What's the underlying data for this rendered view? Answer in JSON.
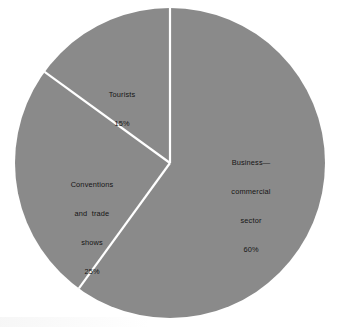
{
  "figure": {
    "background_color": "#ffffff",
    "slice_fill_color": "#8a8a8a",
    "divider_color": "#ffffff",
    "label_text_color": "#151515"
  },
  "chart_data": {
    "type": "pie",
    "title": "",
    "subtitle": "",
    "xlabel": "",
    "ylabel": "",
    "legend": "none",
    "grid": false,
    "start_angle_deg": 0,
    "direction": "clockwise",
    "center": {
      "x": 170,
      "y": 163
    },
    "radius": 155,
    "categories": [
      "Business—commercial sector",
      "Conventions and trade shows",
      "Tourists"
    ],
    "values": [
      60,
      25,
      15
    ],
    "unit": "%",
    "slices": [
      {
        "name": "Business—commercial sector",
        "value": 60,
        "value_label": "60%",
        "label_lines": [
          "Business—",
          "commercial",
          "sector"
        ],
        "color": "#8a8a8a",
        "start_deg": 0,
        "end_deg": 216
      },
      {
        "name": "Conventions and trade shows",
        "value": 25,
        "value_label": "25%",
        "label_lines": [
          "Conventions",
          "and  trade",
          "shows"
        ],
        "color": "#8a8a8a",
        "start_deg": 216,
        "end_deg": 306
      },
      {
        "name": "Tourists",
        "value": 15,
        "value_label": "15%",
        "label_lines": [
          "Tourists"
        ],
        "color": "#8a8a8a",
        "start_deg": 306,
        "end_deg": 360
      }
    ]
  },
  "labels": {
    "business": {
      "line1": "Business—",
      "line2": "commercial",
      "line3": "sector",
      "value": "60%"
    },
    "conventions": {
      "line1": "Conventions",
      "line2": "and  trade",
      "line3": "shows",
      "value": "25%"
    },
    "tourists": {
      "line1": "Tourists",
      "value": "15%"
    }
  }
}
